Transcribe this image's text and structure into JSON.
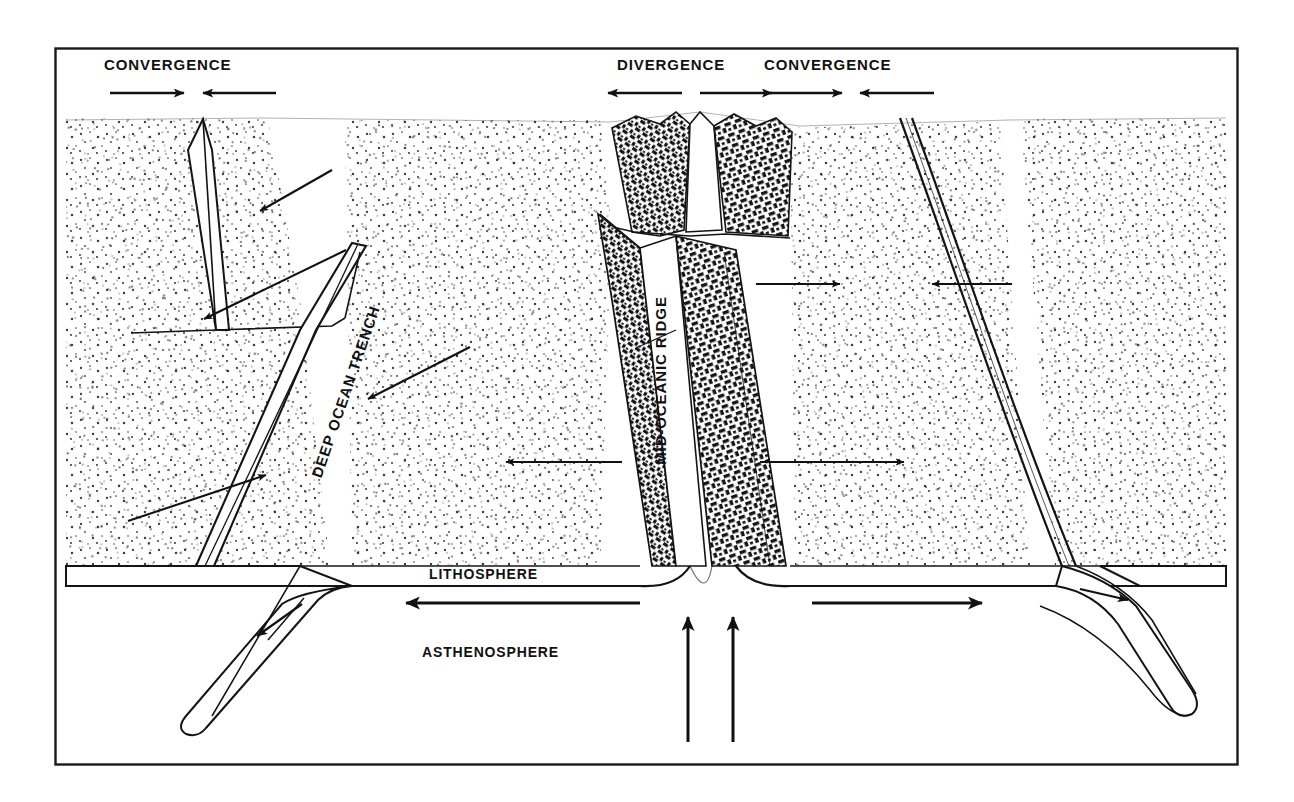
{
  "figure": {
    "frame": {
      "x": 55,
      "y": 48,
      "width": 1183,
      "height": 717,
      "stroke": "#1a1a1a"
    },
    "ink_color": "#111111",
    "background_color": "#ffffff"
  },
  "labels": {
    "convergence_left": "CONVERGENCE",
    "divergence": "DIVERGENCE",
    "convergence_right": "CONVERGENCE",
    "deep_ocean_trench": "DEEP OCEAN TRENCH",
    "mid_oceanic_ridge": "MID-OCEANIC RIDGE",
    "lithosphere": "LITHOSPHERE",
    "asthenosphere": "ASTHENOSPHERE"
  },
  "top_arrows": [
    {
      "name": "convergence-left-right-arrow",
      "direction": "right",
      "x1": 110,
      "x2": 186,
      "y": 93
    },
    {
      "name": "convergence-left-left-arrow",
      "direction": "left",
      "x1": 276,
      "x2": 201,
      "y": 93
    },
    {
      "name": "divergence-left-arrow",
      "direction": "left",
      "x1": 682,
      "x2": 606,
      "y": 93
    },
    {
      "name": "divergence-right-arrow",
      "direction": "right",
      "x1": 698,
      "x2": 774,
      "y": 93
    },
    {
      "name": "convergence-right-right-arrow",
      "direction": "right",
      "x1": 768,
      "x2": 844,
      "y": 93
    },
    {
      "name": "convergence-right-left-arrow",
      "direction": "left",
      "x1": 934,
      "x2": 858,
      "y": 93
    }
  ],
  "seafloor_arrows": [
    {
      "name": "seafloor-arrow-upper-left",
      "direction": "down-left",
      "x1": 330,
      "y1": 170,
      "x2": 258,
      "y2": 212
    },
    {
      "name": "seafloor-arrow-mid-left",
      "direction": "down-left",
      "x1": 345,
      "y1": 250,
      "x2": 202,
      "y2": 320
    },
    {
      "name": "seafloor-arrow-lower-left",
      "direction": "up-right",
      "x1": 128,
      "y1": 521,
      "x2": 268,
      "y2": 474
    },
    {
      "name": "seafloor-arrow-trench-right",
      "direction": "down-left",
      "x1": 470,
      "y1": 347,
      "x2": 366,
      "y2": 400
    },
    {
      "name": "seafloor-arrow-mid-center",
      "direction": "left",
      "x1": 622,
      "y1": 462,
      "x2": 504,
      "y2": 462
    },
    {
      "name": "seafloor-arrow-right-upper",
      "direction": "right",
      "x1": 756,
      "y1": 284,
      "x2": 842,
      "y2": 284
    },
    {
      "name": "seafloor-arrow-right-converge",
      "direction": "left",
      "x1": 1012,
      "y1": 284,
      "x2": 930,
      "y2": 284
    },
    {
      "name": "seafloor-arrow-right-lower",
      "direction": "right",
      "x1": 760,
      "y1": 462,
      "x2": 906,
      "y2": 462
    }
  ],
  "asthenosphere_arrows": [
    {
      "name": "asthenosphere-flow-left-arrow",
      "direction": "left",
      "x1": 640,
      "y1": 603,
      "x2": 402,
      "y2": 603
    },
    {
      "name": "asthenosphere-flow-right-arrow",
      "direction": "right",
      "x1": 812,
      "y1": 603,
      "x2": 986,
      "y2": 603
    },
    {
      "name": "upwelling-arrow-left",
      "direction": "up",
      "x": 688,
      "y1": 740,
      "y2": 613
    },
    {
      "name": "upwelling-arrow-right",
      "direction": "up",
      "x": 733,
      "y1": 740,
      "y2": 613
    }
  ],
  "slab_arrows": [
    {
      "name": "slab-arrow-left",
      "direction": "down-left",
      "x1": 300,
      "y1": 604,
      "x2": 255,
      "y2": 637
    },
    {
      "name": "slab-arrow-right",
      "direction": "down-right",
      "x1": 1085,
      "y1": 591,
      "x2": 1131,
      "y2": 601
    }
  ],
  "features": {
    "lithosphere_band": {
      "top_y": 566,
      "bottom_y": 586,
      "left_x": 66,
      "right_x": 1226
    },
    "ridge_axis_x": 710,
    "left_trench_x": 330,
    "right_trench_x": 1010,
    "rift_valley_label": "rift valley at ridge crest"
  }
}
